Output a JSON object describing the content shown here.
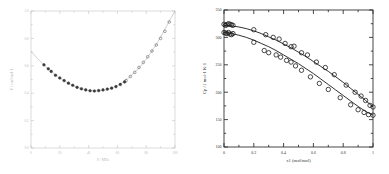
{
  "figure": {
    "panel_count": 2,
    "background_color": "#ffffff"
  },
  "chart_data": [
    {
      "panel": "left",
      "type": "scatter",
      "title": "",
      "xlabel": "P / MPa",
      "ylabel": "V / cm3 mol-1",
      "xlim": [
        0,
        100
      ],
      "ylim": [
        0,
        1
      ],
      "xticks": [
        0,
        20,
        40,
        60,
        80,
        100
      ],
      "xticklabels": [
        "0",
        "20",
        "40",
        "60",
        "80",
        "100"
      ],
      "yticks": [
        0,
        0.2,
        0.4,
        0.6,
        0.8,
        1.0
      ],
      "yticklabels": [
        "0.0",
        "0.2",
        "0.4",
        "0.6",
        "0.8",
        "1.0"
      ],
      "grid": false,
      "legend": "none",
      "axis_color": "#b9b9b9",
      "marker_color": "#3a3a3a",
      "line_color": "#a9a9a9",
      "series": [
        {
          "name": "model curve",
          "style": "line",
          "x": [
            0,
            4,
            8,
            12,
            16,
            20,
            24,
            28,
            32,
            36,
            40,
            44,
            48,
            52,
            56,
            60,
            64,
            68,
            72,
            76,
            80,
            84,
            88,
            92,
            96,
            100
          ],
          "y": [
            0.706,
            0.66,
            0.617,
            0.578,
            0.543,
            0.511,
            0.484,
            0.461,
            0.443,
            0.429,
            0.42,
            0.416,
            0.417,
            0.424,
            0.437,
            0.456,
            0.481,
            0.513,
            0.552,
            0.597,
            0.649,
            0.708,
            0.774,
            0.847,
            0.927,
            1.0
          ]
        },
        {
          "name": "filled data points",
          "style": "markers-filled",
          "x": [
            9,
            12,
            14,
            17,
            20,
            23,
            26,
            29,
            32,
            35,
            38,
            41,
            44,
            47,
            50,
            53,
            56,
            59,
            62,
            65
          ],
          "y": [
            0.607,
            0.578,
            0.559,
            0.531,
            0.511,
            0.492,
            0.473,
            0.458,
            0.443,
            0.432,
            0.424,
            0.418,
            0.416,
            0.419,
            0.424,
            0.43,
            0.437,
            0.448,
            0.464,
            0.482
          ]
        },
        {
          "name": "open data points",
          "style": "markers-open",
          "x": [
            66,
            69,
            72,
            75,
            78,
            81,
            84,
            87,
            90,
            93,
            96
          ],
          "y": [
            0.492,
            0.522,
            0.552,
            0.588,
            0.625,
            0.666,
            0.708,
            0.752,
            0.8,
            0.852,
            0.92
          ]
        }
      ]
    },
    {
      "panel": "right",
      "type": "scatter",
      "title": "",
      "xlabel": "x1 (mol/mol)",
      "ylabel": "Cp / J mol-1 K-1",
      "xlim": [
        0,
        1
      ],
      "ylim": [
        100,
        350
      ],
      "xticks": [
        0,
        0.2,
        0.4,
        0.6,
        0.8,
        1.0
      ],
      "xticklabels": [
        "0",
        "0.2",
        "0.4",
        "0.6",
        "0.8",
        "1"
      ],
      "yticks": [
        100,
        150,
        200,
        250,
        300,
        350
      ],
      "yticklabels": [
        "100",
        "150",
        "200",
        "250",
        "300",
        "350"
      ],
      "grid": false,
      "legend": "none",
      "axis_color": "#333333",
      "marker_color": "#1a1a1a",
      "line_color": "#1a1a1a",
      "series": [
        {
          "name": "upper fit curve",
          "style": "line",
          "x": [
            0,
            0.05,
            0.1,
            0.15,
            0.2,
            0.25,
            0.3,
            0.35,
            0.4,
            0.45,
            0.5,
            0.55,
            0.6,
            0.65,
            0.7,
            0.75,
            0.8,
            0.85,
            0.9,
            0.95,
            1.0
          ],
          "y": [
            322,
            321,
            319,
            316,
            312,
            307,
            301,
            295,
            288,
            281,
            273,
            265,
            256,
            247,
            238,
            228,
            218,
            207,
            196,
            185,
            173
          ]
        },
        {
          "name": "lower fit curve",
          "style": "line",
          "x": [
            0,
            0.05,
            0.1,
            0.15,
            0.2,
            0.25,
            0.3,
            0.35,
            0.4,
            0.45,
            0.5,
            0.55,
            0.6,
            0.65,
            0.7,
            0.75,
            0.8,
            0.85,
            0.9,
            0.95,
            1.0
          ],
          "y": [
            309,
            307,
            304,
            300,
            295,
            289,
            283,
            276,
            268,
            260,
            252,
            243,
            234,
            224,
            214,
            204,
            194,
            184,
            174,
            165,
            158
          ]
        },
        {
          "name": "upper data points",
          "style": "markers-open",
          "x": [
            0.0,
            0.01,
            0.02,
            0.03,
            0.04,
            0.05,
            0.06,
            0.2,
            0.28,
            0.33,
            0.37,
            0.41,
            0.45,
            0.47,
            0.52,
            0.56,
            0.62,
            0.68,
            0.74,
            0.82,
            0.88,
            0.92,
            0.95,
            0.98,
            1.0
          ],
          "y": [
            324,
            322,
            323,
            325,
            324,
            323,
            322,
            314,
            305,
            300,
            297,
            289,
            283,
            284,
            272,
            268,
            255,
            245,
            232,
            213,
            200,
            193,
            185,
            176,
            173
          ]
        },
        {
          "name": "lower data points",
          "style": "markers-open",
          "x": [
            0.0,
            0.01,
            0.02,
            0.03,
            0.04,
            0.05,
            0.06,
            0.2,
            0.27,
            0.3,
            0.35,
            0.38,
            0.42,
            0.45,
            0.48,
            0.52,
            0.58,
            0.64,
            0.7,
            0.78,
            0.85,
            0.9,
            0.94,
            0.97,
            1.0
          ],
          "y": [
            309,
            308,
            307,
            309,
            306,
            305,
            307,
            291,
            276,
            272,
            268,
            264,
            258,
            255,
            248,
            240,
            228,
            216,
            205,
            190,
            177,
            168,
            163,
            159,
            158
          ]
        }
      ]
    }
  ]
}
